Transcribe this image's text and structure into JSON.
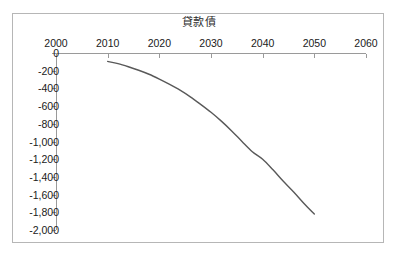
{
  "chart_data": {
    "type": "line",
    "title": "貸款債",
    "xlabel": "",
    "ylabel": "",
    "xlim": [
      2000,
      2060
    ],
    "ylim": [
      -2000,
      0
    ],
    "grid": false,
    "legend": false,
    "axis_x_position": "top",
    "axis_y_position": "left",
    "x_tick_labels": [
      "2000",
      "2010",
      "2020",
      "2030",
      "2040",
      "2050",
      "2060"
    ],
    "x_ticks": [
      2000,
      2010,
      2020,
      2030,
      2040,
      2050,
      2060
    ],
    "y_tick_labels": [
      "0",
      "-200",
      "-400",
      "-600",
      "-800",
      "-1,000",
      "-1,200",
      "-1,400",
      "-1,600",
      "-1,800",
      "-2,000"
    ],
    "y_ticks": [
      0,
      -200,
      -400,
      -600,
      -800,
      -1000,
      -1200,
      -1400,
      -1600,
      -1800,
      -2000
    ],
    "series": [
      {
        "name": "貸款債",
        "color": "#595959",
        "x": [
          2010,
          2012,
          2014,
          2016,
          2018,
          2020,
          2022,
          2024,
          2026,
          2028,
          2030,
          2032,
          2034,
          2036,
          2038,
          2040,
          2042,
          2044,
          2046,
          2048,
          2050
        ],
        "values": [
          -95,
          -120,
          -155,
          -195,
          -240,
          -295,
          -355,
          -420,
          -495,
          -580,
          -670,
          -770,
          -880,
          -1000,
          -1115,
          -1200,
          -1320,
          -1450,
          -1570,
          -1700,
          -1820
        ]
      }
    ]
  },
  "frame": {
    "border_color": "#b6b6b6",
    "background": "#ffffff",
    "axis_color": "#9a9a9a"
  }
}
